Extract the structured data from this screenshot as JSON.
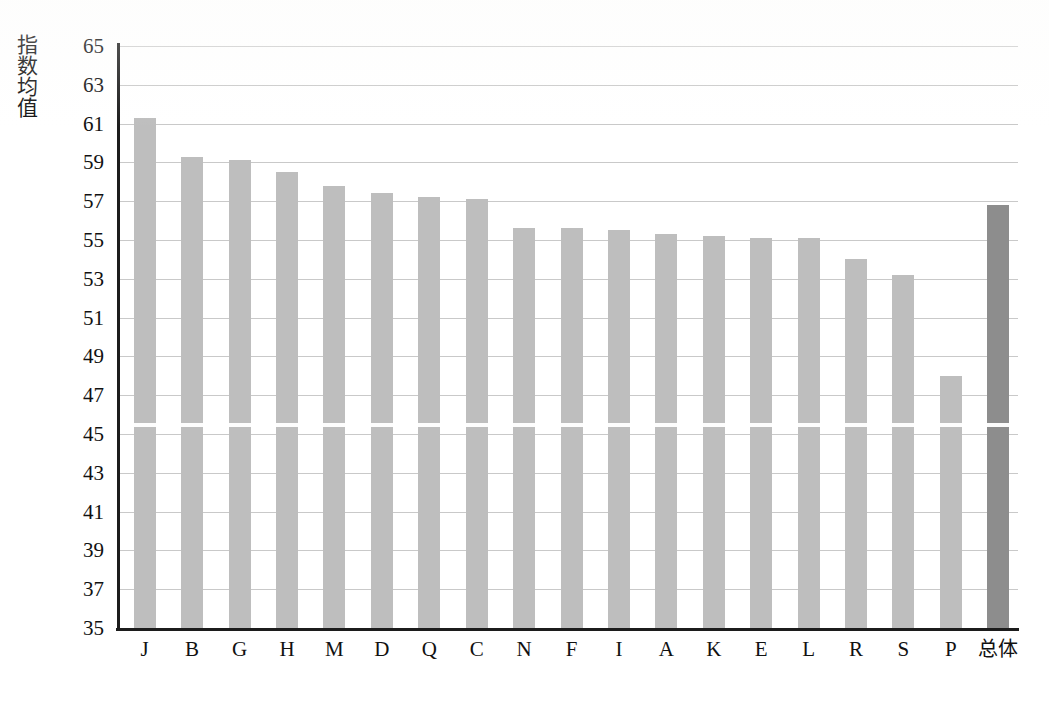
{
  "chart_data": {
    "type": "bar",
    "title": "",
    "xlabel": "",
    "ylabel": "指数均值",
    "ylim": [
      35,
      65
    ],
    "ytick_step": 2,
    "grid": true,
    "legend": "none",
    "categories": [
      "J",
      "B",
      "G",
      "H",
      "M",
      "D",
      "Q",
      "C",
      "N",
      "F",
      "I",
      "A",
      "K",
      "E",
      "L",
      "R",
      "S",
      "P",
      "总体"
    ],
    "values": [
      61.3,
      59.3,
      59.1,
      58.5,
      57.8,
      57.4,
      57.2,
      57.1,
      55.6,
      55.6,
      55.5,
      55.3,
      55.2,
      55.1,
      55.1,
      54.0,
      53.2,
      48.0,
      56.8
    ],
    "ytick_labels": [
      "65",
      "63",
      "61",
      "59",
      "57",
      "55",
      "53",
      "51",
      "49",
      "47",
      "45",
      "43",
      "41",
      "39",
      "37",
      "35"
    ],
    "series": [
      {
        "name": "指数均值",
        "values": [
          61.3,
          59.3,
          59.1,
          58.5,
          57.8,
          57.4,
          57.2,
          57.1,
          55.6,
          55.6,
          55.5,
          55.3,
          55.2,
          55.1,
          55.1,
          54.0,
          53.2,
          48.0,
          56.8
        ]
      }
    ],
    "colors": {
      "bar": "#bebebe",
      "bar_total": "#8d8d8d",
      "grid": "#c9c9c9",
      "axis": "#1c1c1c",
      "text": "#111111",
      "background": "#ffffff"
    },
    "highlight_category": "总体",
    "annotations": []
  }
}
